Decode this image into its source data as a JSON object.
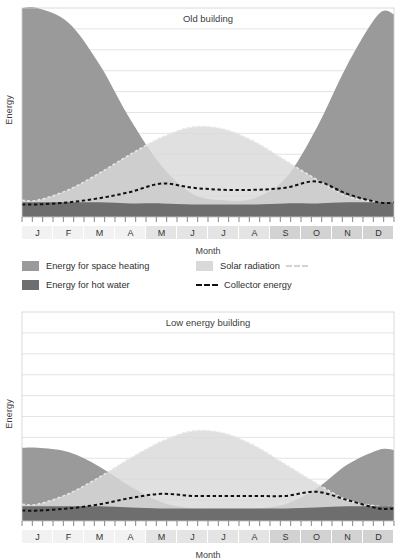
{
  "axes": {
    "y_label": "Energy",
    "x_label": "Month",
    "months": [
      "J",
      "F",
      "M",
      "A",
      "M",
      "J",
      "J",
      "A",
      "S",
      "O",
      "N",
      "D"
    ]
  },
  "legend": {
    "space_heating": "Energy for space heating",
    "hot_water": "Energy for hot water",
    "solar_radiation": "Solar radiation",
    "collector_energy": "Collector energy"
  },
  "colors": {
    "space_heating": "#9a9a9a",
    "hot_water": "#6e6e6e",
    "solar_radiation": "#d9d9d9",
    "collector_energy": "#111111",
    "solar_dash": "#e6e6e6",
    "grid": "#d8d8d8",
    "frame": "#cfcfcf",
    "band_light": "#efefef",
    "band_dark": "#d5d5d5",
    "text": "#3a3a3a"
  },
  "chart_data": [
    {
      "type": "area",
      "title": "Old building",
      "xlabel": "Month",
      "ylabel": "Energy",
      "categories": [
        "J",
        "F",
        "M",
        "A",
        "M",
        "J",
        "J",
        "A",
        "S",
        "O",
        "N",
        "D"
      ],
      "ylim": [
        0,
        100
      ],
      "grid": true,
      "gridlines": 10,
      "legend_position": "below",
      "series": [
        {
          "name": "Energy for hot water",
          "fill": "#6e6e6e",
          "values": [
            7,
            7,
            7,
            6.5,
            6.5,
            6,
            6,
            6,
            6.5,
            6.5,
            7,
            7
          ]
        },
        {
          "name": "Energy for space heating",
          "fill": "#9a9a9a",
          "values": [
            93,
            86,
            66,
            40,
            18,
            5,
            2,
            3,
            12,
            36,
            66,
            90
          ]
        },
        {
          "name": "Solar radiation",
          "fill": "#d9d9d9",
          "dashed_top": true,
          "values": [
            8,
            13,
            21,
            30,
            38,
            43,
            42,
            36,
            27,
            18,
            10,
            7
          ]
        },
        {
          "name": "Collector energy",
          "stroke": "#111111",
          "dashed": true,
          "values": [
            6,
            7,
            9,
            12,
            16,
            14,
            13,
            13,
            14,
            17,
            11,
            7
          ]
        }
      ]
    },
    {
      "type": "area",
      "title": "Low energy building",
      "xlabel": "Month",
      "ylabel": "Energy",
      "categories": [
        "J",
        "F",
        "M",
        "A",
        "M",
        "J",
        "J",
        "A",
        "S",
        "O",
        "N",
        "D"
      ],
      "ylim": [
        0,
        100
      ],
      "grid": true,
      "gridlines": 10,
      "legend_position": "none",
      "series": [
        {
          "name": "Energy for hot water",
          "fill": "#6e6e6e",
          "values": [
            7,
            7,
            7,
            6.5,
            6,
            6,
            6,
            6,
            6,
            6.5,
            7,
            7
          ]
        },
        {
          "name": "Energy for space heating",
          "fill": "#9a9a9a",
          "values": [
            28,
            26,
            19,
            10,
            3,
            0,
            0,
            0,
            2,
            9,
            20,
            27
          ]
        },
        {
          "name": "Solar radiation",
          "fill": "#d9d9d9",
          "dashed_top": true,
          "values": [
            8,
            13,
            21,
            30,
            38,
            43,
            42,
            36,
            27,
            18,
            10,
            7
          ]
        },
        {
          "name": "Collector energy",
          "stroke": "#111111",
          "dashed": true,
          "values": [
            5,
            6,
            8,
            11,
            13,
            12,
            12,
            12,
            12,
            14,
            10,
            6
          ]
        }
      ]
    }
  ]
}
